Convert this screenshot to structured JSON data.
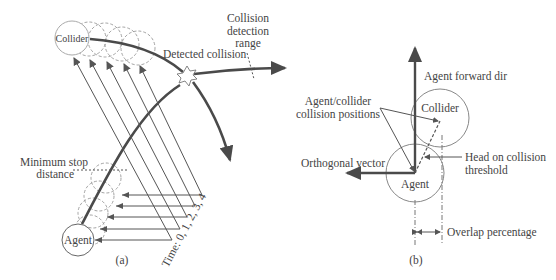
{
  "panel_a": {
    "caption": "(a)",
    "labels": {
      "collider": "Collider",
      "agent": "Agent",
      "detected_collision": "Detected collision",
      "collision_detection_range_1": "Collision",
      "collision_detection_range_2": "detection",
      "collision_detection_range_3": "range",
      "minimum_stop_1": "Minimum stop",
      "minimum_stop_2": "distance",
      "time_axis": "Time: 0, 1, 2, 3, 4"
    }
  },
  "panel_b": {
    "caption": "(b)",
    "labels": {
      "agent_forward_dir": "Agent forward dir",
      "collision_positions_1": "Agent/collider",
      "collision_positions_2": "collision positions",
      "collider": "Collider",
      "agent": "Agent",
      "orthogonal_vector": "Orthogonal vector",
      "head_on_1": "Head on collision",
      "head_on_2": "threshold",
      "overlap_percentage": "Overlap percentage"
    }
  },
  "colors": {
    "stroke": "#555555",
    "thick_stroke": "#4a4a4a",
    "dashed": "#999999",
    "text": "#444444"
  }
}
